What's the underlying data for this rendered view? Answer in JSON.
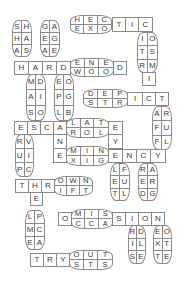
{
  "puzzle": {
    "hectic": {
      "pair_top": [
        "H",
        "E",
        "C"
      ],
      "pair_bottom": [
        "E",
        "X",
        "O"
      ],
      "cells": [
        "T",
        "I",
        "C"
      ]
    },
    "col_sha": [
      "S",
      "H",
      "H",
      "A",
      "A",
      "S"
    ],
    "col_gae": [
      "G",
      "A",
      "E",
      "G",
      "A",
      "E"
    ],
    "col_itr": [
      "I",
      "O",
      "T",
      "S",
      "R",
      "M"
    ],
    "hard": {
      "cells": [
        "H",
        "A",
        "R",
        "D"
      ],
      "pair_top": [
        "E",
        "N",
        "E"
      ],
      "pair_bottom": [
        "W",
        "O",
        "O"
      ],
      "end": "D"
    },
    "i_below": "I",
    "col_mas": [
      "M",
      "D",
      "A",
      "I",
      "S",
      "O"
    ],
    "col_epl": [
      "E",
      "O",
      "P",
      "G",
      "L",
      "B"
    ],
    "depict": {
      "pair_top": [
        "D",
        "E",
        "P"
      ],
      "pair_bottom": [
        "S",
        "T",
        "R"
      ],
      "cells": [
        "I",
        "C",
        "T"
      ]
    },
    "col_aff": [
      "A",
      "R",
      "F",
      "U",
      "F",
      "L"
    ],
    "escalate": {
      "cells": [
        "E",
        "S",
        "C",
        "A"
      ],
      "pair_top": [
        "L",
        "A",
        "T"
      ],
      "pair_bottom": [
        "R",
        "O",
        "L"
      ],
      "end": "E"
    },
    "y_below": "Y",
    "n_below": "N",
    "col_rup": [
      "R",
      "V",
      "U",
      "I",
      "P",
      "C"
    ],
    "eminency": {
      "start": "E",
      "pair_top": [
        "M",
        "I",
        "N"
      ],
      "pair_bottom": [
        "X",
        "I",
        "G"
      ],
      "cells": [
        "E",
        "N",
        "C",
        "Y"
      ]
    },
    "col_let": [
      "L",
      "F",
      "E",
      "U",
      "T",
      "L"
    ],
    "col_red": [
      "R",
      "A",
      "E",
      "R",
      "D",
      "G"
    ],
    "thrown": {
      "cells": [
        "T",
        "H",
        "R"
      ],
      "pair_top": [
        "O",
        "W",
        "N"
      ],
      "pair_bottom": [
        "I",
        "F",
        "T"
      ]
    },
    "e_below": "E",
    "col_lme": [
      "L",
      "P",
      "M",
      "C",
      "E",
      "A"
    ],
    "omission": {
      "start": "O",
      "pair_top": [
        "M",
        "I",
        "S"
      ],
      "pair_bottom": [
        "C",
        "C",
        "A"
      ],
      "cells": [
        "S",
        "I",
        "O",
        "N"
      ]
    },
    "col_ris": [
      "R",
      "D",
      "I",
      "L",
      "S",
      "E"
    ],
    "col_ext": [
      "E",
      "O",
      "X",
      "T",
      "T",
      "E"
    ],
    "tryouts": {
      "cells": [
        "T",
        "R",
        "Y"
      ],
      "pair_top": [
        "O",
        "U",
        "T"
      ],
      "pair_bottom": [
        "S",
        "T",
        "S"
      ]
    }
  }
}
